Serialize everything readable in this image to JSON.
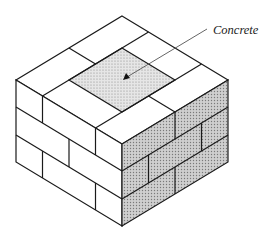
{
  "figure": {
    "annotation": {
      "label": "Concrete",
      "arrow_target": "center of top core"
    },
    "colors": {
      "line": "#1a1a1a",
      "brick_face": "#ffffff",
      "shaded_face": "#bdbdbd",
      "concrete_fill": "#d8d8d8",
      "leader_line": "#555555"
    },
    "courses": 3
  }
}
